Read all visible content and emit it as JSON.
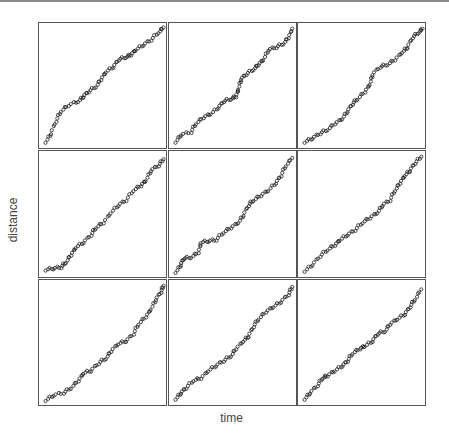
{
  "chart_data": {
    "type": "scatter",
    "layout": "3x3 small multiples",
    "xlabel": "time",
    "ylabel": "distance",
    "grid": false,
    "axis_ticks": false,
    "marker": "open-circle",
    "marker_color": "#222222",
    "panels": [
      {
        "x": [
          0.04,
          0.08,
          0.12,
          0.16,
          0.22,
          0.3,
          0.34,
          0.38,
          0.44,
          0.48,
          0.52,
          0.58,
          0.62,
          0.68,
          0.72,
          0.76,
          0.82,
          0.88,
          0.94,
          0.98
        ],
        "y": [
          0.05,
          0.12,
          0.22,
          0.3,
          0.35,
          0.38,
          0.42,
          0.46,
          0.5,
          0.56,
          0.62,
          0.66,
          0.72,
          0.74,
          0.76,
          0.8,
          0.84,
          0.88,
          0.94,
          0.98
        ]
      },
      {
        "x": [
          0.04,
          0.08,
          0.16,
          0.2,
          0.26,
          0.32,
          0.38,
          0.42,
          0.48,
          0.52,
          0.54,
          0.56,
          0.6,
          0.66,
          0.7,
          0.74,
          0.78,
          0.84,
          0.9,
          0.94,
          0.97
        ],
        "y": [
          0.05,
          0.11,
          0.13,
          0.2,
          0.25,
          0.28,
          0.33,
          0.38,
          0.4,
          0.42,
          0.48,
          0.56,
          0.6,
          0.64,
          0.68,
          0.72,
          0.8,
          0.82,
          0.85,
          0.9,
          0.97
        ]
      },
      {
        "x": [
          0.04,
          0.1,
          0.16,
          0.22,
          0.28,
          0.34,
          0.38,
          0.42,
          0.46,
          0.52,
          0.56,
          0.58,
          0.64,
          0.7,
          0.76,
          0.82,
          0.86,
          0.9,
          0.95,
          0.98
        ],
        "y": [
          0.05,
          0.08,
          0.12,
          0.15,
          0.2,
          0.24,
          0.3,
          0.36,
          0.4,
          0.46,
          0.52,
          0.6,
          0.66,
          0.68,
          0.72,
          0.78,
          0.82,
          0.9,
          0.94,
          0.97
        ]
      },
      {
        "x": [
          0.04,
          0.1,
          0.16,
          0.2,
          0.24,
          0.28,
          0.34,
          0.4,
          0.44,
          0.5,
          0.56,
          0.62,
          0.68,
          0.74,
          0.8,
          0.84,
          0.88,
          0.94,
          0.98
        ],
        "y": [
          0.06,
          0.07,
          0.08,
          0.12,
          0.18,
          0.24,
          0.28,
          0.34,
          0.4,
          0.44,
          0.52,
          0.58,
          0.62,
          0.7,
          0.74,
          0.78,
          0.86,
          0.9,
          0.95
        ]
      },
      {
        "x": [
          0.04,
          0.08,
          0.1,
          0.16,
          0.22,
          0.24,
          0.3,
          0.36,
          0.42,
          0.48,
          0.54,
          0.58,
          0.62,
          0.66,
          0.72,
          0.78,
          0.84,
          0.88,
          0.92,
          0.97
        ],
        "y": [
          0.04,
          0.1,
          0.15,
          0.16,
          0.2,
          0.28,
          0.29,
          0.3,
          0.36,
          0.4,
          0.44,
          0.5,
          0.58,
          0.62,
          0.66,
          0.7,
          0.76,
          0.82,
          0.9,
          0.96
        ]
      },
      {
        "x": [
          0.04,
          0.1,
          0.16,
          0.22,
          0.28,
          0.32,
          0.38,
          0.44,
          0.5,
          0.56,
          0.62,
          0.66,
          0.72,
          0.76,
          0.8,
          0.84,
          0.88,
          0.92,
          0.97
        ],
        "y": [
          0.05,
          0.1,
          0.17,
          0.22,
          0.26,
          0.3,
          0.34,
          0.38,
          0.44,
          0.48,
          0.52,
          0.58,
          0.62,
          0.7,
          0.76,
          0.82,
          0.86,
          0.92,
          0.97
        ]
      },
      {
        "x": [
          0.04,
          0.1,
          0.18,
          0.24,
          0.3,
          0.34,
          0.4,
          0.46,
          0.52,
          0.56,
          0.62,
          0.68,
          0.74,
          0.78,
          0.84,
          0.88,
          0.92,
          0.96,
          0.98
        ],
        "y": [
          0.04,
          0.08,
          0.1,
          0.14,
          0.2,
          0.26,
          0.28,
          0.34,
          0.38,
          0.44,
          0.5,
          0.52,
          0.58,
          0.66,
          0.72,
          0.78,
          0.86,
          0.92,
          0.97
        ]
      },
      {
        "x": [
          0.04,
          0.08,
          0.12,
          0.18,
          0.24,
          0.3,
          0.36,
          0.42,
          0.48,
          0.52,
          0.58,
          0.62,
          0.66,
          0.7,
          0.76,
          0.82,
          0.88,
          0.94,
          0.97
        ],
        "y": [
          0.05,
          0.1,
          0.14,
          0.2,
          0.22,
          0.28,
          0.32,
          0.36,
          0.4,
          0.46,
          0.52,
          0.56,
          0.64,
          0.7,
          0.76,
          0.8,
          0.84,
          0.9,
          0.96
        ]
      },
      {
        "x": [
          0.04,
          0.08,
          0.14,
          0.18,
          0.22,
          0.28,
          0.34,
          0.38,
          0.42,
          0.48,
          0.52,
          0.58,
          0.62,
          0.68,
          0.72,
          0.78,
          0.84,
          0.88,
          0.92,
          0.97
        ],
        "y": [
          0.05,
          0.1,
          0.16,
          0.22,
          0.24,
          0.28,
          0.32,
          0.36,
          0.42,
          0.46,
          0.48,
          0.52,
          0.58,
          0.6,
          0.66,
          0.7,
          0.74,
          0.8,
          0.86,
          0.94
        ]
      }
    ]
  }
}
